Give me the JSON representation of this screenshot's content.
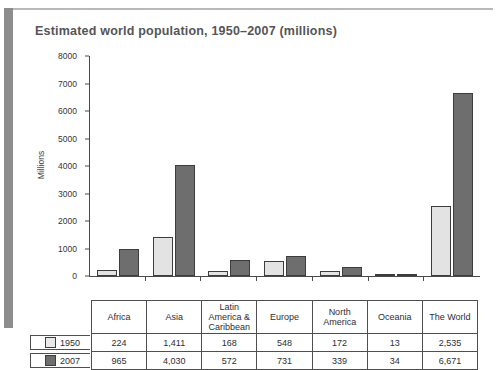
{
  "chart_data": {
    "type": "bar",
    "title": "Estimated world population, 1950–2007 (millions)",
    "xlabel": "",
    "ylabel": "Millions",
    "ylim": [
      0,
      8000
    ],
    "ytick_step": 1000,
    "yticks": [
      "8000",
      "7000",
      "6000",
      "5000",
      "4000",
      "3000",
      "2000",
      "1000",
      "0"
    ],
    "grid": false,
    "legend_position": "table-left",
    "categories": [
      "Africa",
      "Asia",
      "Latin America & Caribbean",
      "Europe",
      "North America",
      "Oceania",
      "The World"
    ],
    "category_lines": [
      [
        "Africa"
      ],
      [
        "Asia"
      ],
      [
        "Latin",
        "America &",
        "Caribbean"
      ],
      [
        "Europe"
      ],
      [
        "North",
        "America"
      ],
      [
        "Oceania"
      ],
      [
        "The World"
      ]
    ],
    "series": [
      {
        "name": "1950",
        "color": "#e3e3e3",
        "values": [
          224,
          1411,
          168,
          548,
          172,
          13,
          2535
        ],
        "labels": [
          "224",
          "1,411",
          "168",
          "548",
          "172",
          "13",
          "2,535"
        ]
      },
      {
        "name": "2007",
        "color": "#6e6e6e",
        "values": [
          965,
          4030,
          572,
          731,
          339,
          34,
          6671
        ],
        "labels": [
          "965",
          "4,030",
          "572",
          "731",
          "339",
          "34",
          "6,671"
        ]
      }
    ]
  },
  "colors": {
    "series_1950": "#e3e3e3",
    "series_2007": "#6e6e6e",
    "axis": "#4a4a4a",
    "title": "#555558",
    "table_border": "#4f4f4f",
    "background": "#ffffff"
  }
}
